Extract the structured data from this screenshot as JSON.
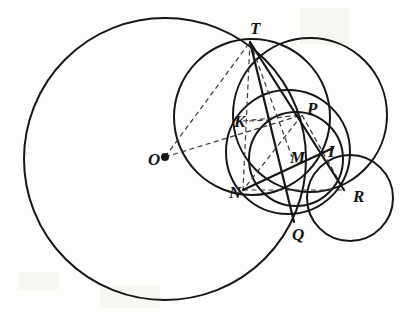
{
  "figure": {
    "background_color": "#fdfdfb",
    "stroke_color": "#161616",
    "dash_color": "#3a3a3a",
    "width": 413,
    "height": 316
  },
  "labels": {
    "O": "O",
    "T": "T",
    "K": "K",
    "P": "P",
    "M": "M",
    "I": "I",
    "N": "N",
    "Q": "Q",
    "R": "R"
  },
  "chart_data": {
    "type": "diagram",
    "subtype": "euclidean-geometry-circles",
    "xlim": [
      0,
      413
    ],
    "ylim": [
      0,
      316
    ],
    "grid": false,
    "legend": null,
    "points": [
      {
        "name": "O",
        "x": 165,
        "y": 157,
        "dot": true,
        "label_dx": -17,
        "label_dy": 6
      },
      {
        "name": "T",
        "x": 250,
        "y": 42,
        "dot": false,
        "label_dx": 0,
        "label_dy": -10
      },
      {
        "name": "K",
        "x": 246,
        "y": 122,
        "dot": false,
        "label_dx": -12,
        "label_dy": 3
      },
      {
        "name": "P",
        "x": 302,
        "y": 115,
        "dot": false,
        "label_dx": 5,
        "label_dy": -3
      },
      {
        "name": "M",
        "x": 292,
        "y": 157,
        "dot": false,
        "label_dx": -2,
        "label_dy": 4
      },
      {
        "name": "I",
        "x": 327,
        "y": 152,
        "dot": false,
        "label_dx": 1,
        "label_dy": 3
      },
      {
        "name": "N",
        "x": 243,
        "y": 190,
        "dot": false,
        "label_dx": -14,
        "label_dy": 6
      },
      {
        "name": "Q",
        "x": 294,
        "y": 222,
        "dot": false,
        "label_dx": -2,
        "label_dy": 16
      },
      {
        "name": "R",
        "x": 344,
        "y": 190,
        "dot": false,
        "label_dx": 9,
        "label_dy": 10
      }
    ],
    "circles": [
      {
        "name": "big-circle-O",
        "cx": 165,
        "cy": 159,
        "r": 141,
        "stroke_width": 2.0
      },
      {
        "name": "circle-through-T-right",
        "cx": 310,
        "cy": 115,
        "r": 77,
        "stroke_width": 2.0
      },
      {
        "name": "circle-T-N",
        "cx": 252,
        "cy": 117,
        "r": 78,
        "stroke_width": 2.0
      },
      {
        "name": "circle-P-N-Q",
        "cx": 288,
        "cy": 152,
        "r": 62,
        "stroke_width": 2.0
      },
      {
        "name": "circle-M",
        "cx": 296,
        "cy": 159,
        "r": 47,
        "stroke_width": 2.0
      },
      {
        "name": "circle-R-small",
        "cx": 350,
        "cy": 198,
        "r": 43,
        "stroke_width": 2.0
      }
    ],
    "solid_segments": [
      {
        "name": "T-R",
        "x1": 250,
        "y1": 42,
        "x2": 344,
        "y2": 190
      },
      {
        "name": "T-Q",
        "x1": 250,
        "y1": 42,
        "x2": 294,
        "y2": 222
      },
      {
        "name": "N-I",
        "x1": 243,
        "y1": 190,
        "x2": 333,
        "y2": 148
      }
    ],
    "dashed_segments": [
      {
        "name": "O-T",
        "x1": 165,
        "y1": 157,
        "x2": 250,
        "y2": 42
      },
      {
        "name": "O-P",
        "x1": 165,
        "y1": 157,
        "x2": 302,
        "y2": 115
      },
      {
        "name": "T-K-N",
        "x1": 250,
        "y1": 42,
        "x2": 243,
        "y2": 190
      },
      {
        "name": "T-M",
        "x1": 250,
        "y1": 42,
        "x2": 292,
        "y2": 157
      },
      {
        "name": "K-P",
        "x1": 243,
        "y1": 121,
        "x2": 302,
        "y2": 115
      },
      {
        "name": "N-R",
        "x1": 243,
        "y1": 190,
        "x2": 344,
        "y2": 190
      },
      {
        "name": "P-N",
        "x1": 302,
        "y1": 115,
        "x2": 243,
        "y2": 190
      },
      {
        "name": "P-M-R",
        "x1": 302,
        "y1": 115,
        "x2": 344,
        "y2": 190
      },
      {
        "name": "K-tick",
        "x1": 249,
        "y1": 121,
        "x2": 268,
        "y2": 120
      }
    ]
  }
}
